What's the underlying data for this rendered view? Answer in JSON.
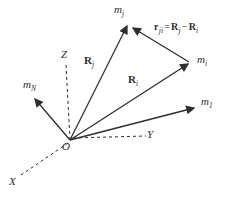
{
  "colors": {
    "ink": "#2e2e2e",
    "background": "#ffffff"
  },
  "axes": {
    "x": "X",
    "y": "Y",
    "z": "Z",
    "origin": "O"
  },
  "labels": {
    "mj": {
      "main": "m",
      "sub": "j"
    },
    "mi": {
      "main": "m",
      "sub": "i"
    },
    "m1": {
      "main": "m",
      "sub": "1"
    },
    "mN": {
      "main": "m",
      "sub": "N"
    },
    "Rj": {
      "main": "R",
      "sub": "j"
    },
    "Ri": {
      "main": "R",
      "sub": "i"
    }
  },
  "equation": {
    "lhs": {
      "main": "r",
      "sub": "ji"
    },
    "equals": "=",
    "term1": {
      "main": "R",
      "sub": "j"
    },
    "minus": "−",
    "term2": {
      "main": "R",
      "sub": "i"
    }
  }
}
